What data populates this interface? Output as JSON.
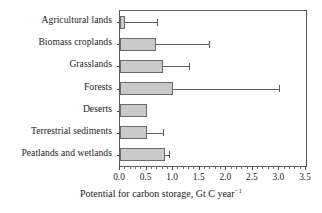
{
  "chart_data": {
    "type": "bar",
    "orientation": "horizontal",
    "title": "",
    "xlabel": "Potential for carbon storage, Gt C year⁻¹",
    "ylabel": "",
    "xlim": [
      0.0,
      3.5
    ],
    "xticks": [
      0.0,
      0.5,
      1.0,
      1.5,
      2.0,
      2.5,
      3.0,
      3.5
    ],
    "xticklabels": [
      "0.0",
      "0.5",
      "1.0",
      "1.5",
      "2.0",
      "2.5",
      "3.0",
      "3.5"
    ],
    "grid": false,
    "legend": null,
    "categories": [
      "Agricultural lands",
      "Biomass croplands",
      "Grasslands",
      "Forests",
      "Deserts",
      "Terrestrial sediments",
      "Peatlands and wetlands"
    ],
    "values": [
      0.09,
      0.68,
      0.8,
      1.0,
      0.5,
      0.5,
      0.85
    ],
    "error_upper": [
      0.7,
      1.68,
      1.3,
      3.0,
      null,
      0.8,
      0.92
    ],
    "bar_fill_color": "#c9c9c9",
    "bar_edge_color": "#6b6b6b",
    "error_bar_color": "#5c5c5c",
    "axis_color": "#5a5a5a"
  },
  "axis_title": {
    "text_main": "Potential for carbon storage, Gt C year",
    "text_sup": "−1"
  }
}
